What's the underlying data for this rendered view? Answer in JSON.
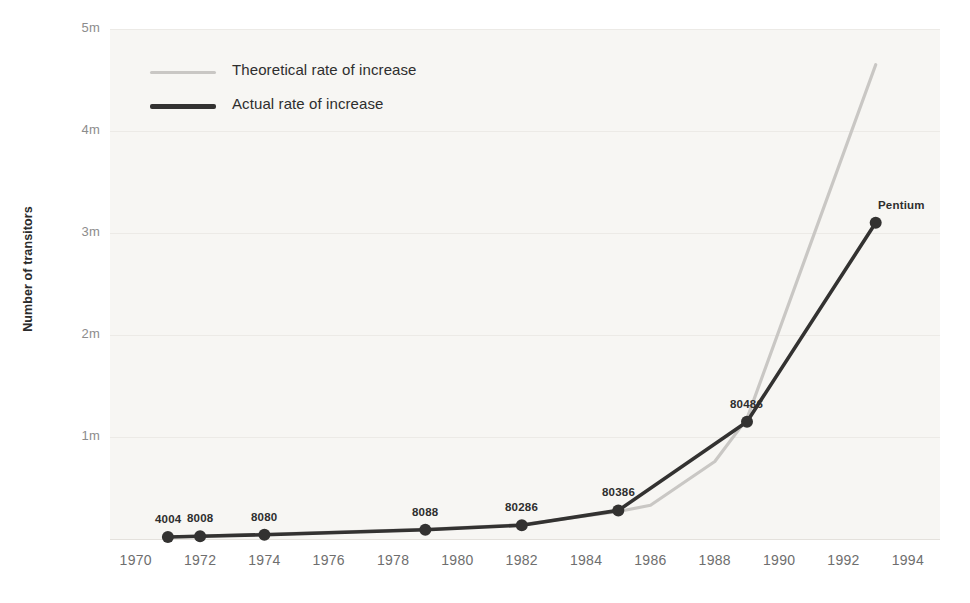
{
  "chart_data": {
    "type": "line",
    "title": "",
    "xlabel": "",
    "ylabel": "Number of transitors",
    "xlim": [
      1969.2,
      1995.0
    ],
    "ylim": [
      0,
      5000000
    ],
    "grid": true,
    "legend_position": "top-left",
    "y_ticks": [
      {
        "value": 1000000,
        "label": "1m"
      },
      {
        "value": 2000000,
        "label": "2m"
      },
      {
        "value": 3000000,
        "label": "3m"
      },
      {
        "value": 4000000,
        "label": "4m"
      },
      {
        "value": 5000000,
        "label": "5m"
      }
    ],
    "x_ticks": [
      {
        "value": 1970,
        "label": "1970"
      },
      {
        "value": 1972,
        "label": "1972"
      },
      {
        "value": 1974,
        "label": "1974"
      },
      {
        "value": 1976,
        "label": "1976"
      },
      {
        "value": 1978,
        "label": "1978"
      },
      {
        "value": 1980,
        "label": "1980"
      },
      {
        "value": 1982,
        "label": "1982"
      },
      {
        "value": 1984,
        "label": "1984"
      },
      {
        "value": 1986,
        "label": "1986"
      },
      {
        "value": 1988,
        "label": "1988"
      },
      {
        "value": 1990,
        "label": "1990"
      },
      {
        "value": 1992,
        "label": "1992"
      },
      {
        "value": 1994,
        "label": "1994"
      }
    ],
    "series": [
      {
        "name": "Theoretical rate of increase",
        "color": "#c9c7c4",
        "x": [
          1971,
          1972,
          1974,
          1979,
          1982,
          1985,
          1986,
          1988,
          1989,
          1993
        ],
        "values": [
          20000,
          28000,
          45000,
          95000,
          140000,
          270000,
          330000,
          760000,
          1180000,
          4650000
        ]
      },
      {
        "name": "Actual rate of increase",
        "color": "#333231",
        "x": [
          1971,
          1972,
          1974,
          1979,
          1982,
          1985,
          1989,
          1993
        ],
        "values": [
          20000,
          26000,
          42000,
          90000,
          135000,
          280000,
          1150000,
          3100000
        ]
      }
    ],
    "point_labels": [
      {
        "text": "4004",
        "x": 1971,
        "value": 20000
      },
      {
        "text": "8008",
        "x": 1972,
        "value": 26000
      },
      {
        "text": "8080",
        "x": 1974,
        "value": 42000
      },
      {
        "text": "8088",
        "x": 1979,
        "value": 90000
      },
      {
        "text": "80286",
        "x": 1982,
        "value": 135000
      },
      {
        "text": "80386",
        "x": 1985,
        "value": 280000
      },
      {
        "text": "80486",
        "x": 1989,
        "value": 1150000
      },
      {
        "text": "Pentium",
        "x": 1993,
        "value": 3100000
      }
    ]
  },
  "legend": {
    "items": [
      {
        "label": "Theoretical rate of increase",
        "color": "#c9c7c4"
      },
      {
        "label": "Actual rate of increase",
        "color": "#333231"
      }
    ]
  },
  "colors": {
    "plot_background": "#f7f6f3",
    "gridline": "#eceae6",
    "actual": "#333231",
    "theoretical": "#c9c7c4",
    "tick_text": "#8c8c8c",
    "axis_title": "#2b2b2b"
  }
}
